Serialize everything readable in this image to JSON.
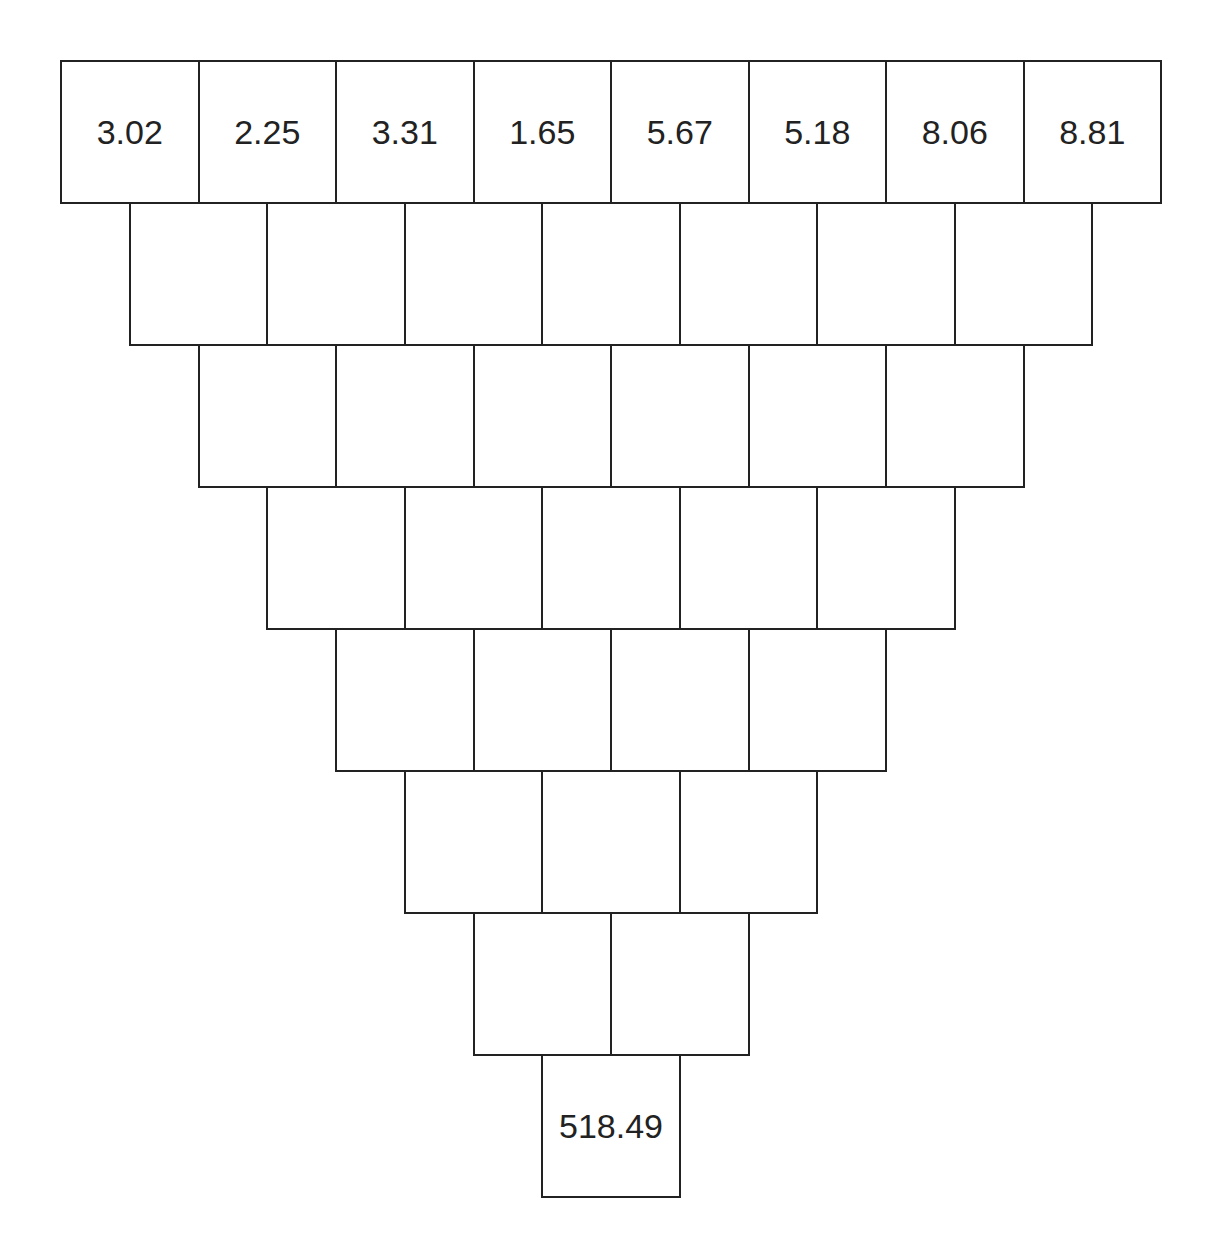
{
  "diagram": {
    "type": "number-pyramid-inverted",
    "layout": {
      "left": 60,
      "top": 60,
      "cell_width": 137.5,
      "cell_height": 142,
      "row_offset": 68.75,
      "line_color": "#222222",
      "text_color": "#222222",
      "background": "#ffffff"
    },
    "rows": [
      [
        "3.02",
        "2.25",
        "3.31",
        "1.65",
        "5.67",
        "5.18",
        "8.06",
        "8.81"
      ],
      [
        "",
        "",
        "",
        "",
        "",
        "",
        ""
      ],
      [
        "",
        "",
        "",
        "",
        "",
        ""
      ],
      [
        "",
        "",
        "",
        "",
        ""
      ],
      [
        "",
        "",
        "",
        ""
      ],
      [
        "",
        "",
        ""
      ],
      [
        "",
        ""
      ],
      [
        "518.49"
      ]
    ]
  }
}
